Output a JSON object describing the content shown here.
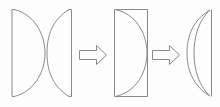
{
  "figure": {
    "description": "Three-stage schematic: two separate plano-convex lens elements are joined into a rectangular blank containing a curved interface, which is then shaped into a finished biconvex lens.",
    "background_color": "#fdfdfd",
    "stroke_color": "#8a8a8a",
    "stroke_width": 1,
    "width": 220,
    "height": 107
  },
  "stages": [
    {
      "id": "stage-1",
      "label": "Two separate lens elements",
      "elements": [
        {
          "id": "element-1a",
          "name": "plano-convex-lens-left",
          "shape": "plano-convex",
          "flat_side": "left",
          "curved_side": "right",
          "bbox": {
            "x": 11,
            "y": 9,
            "width": 34,
            "height": 88
          }
        },
        {
          "id": "element-1b",
          "name": "concave-convex-lens-right",
          "shape": "plano-convex",
          "flat_side": "right",
          "curved_side": "left",
          "bbox": {
            "x": 47,
            "y": 9,
            "width": 25,
            "height": 88
          }
        }
      ]
    },
    {
      "id": "stage-2",
      "label": "Bonded rectangular blank with curved interface",
      "elements": [
        {
          "id": "element-2a",
          "name": "bonded-lens-blank",
          "shape": "rectangle-with-internal-arc",
          "arc_bulge": "right",
          "bbox": {
            "x": 114,
            "y": 9,
            "width": 34,
            "height": 88
          }
        }
      ]
    },
    {
      "id": "stage-3",
      "label": "Finished biconvex lens",
      "elements": [
        {
          "id": "element-3a",
          "name": "biconvex-lens",
          "shape": "biconvex-leaf",
          "flat_edge": "right",
          "bbox": {
            "x": 186,
            "y": 9,
            "width": 27,
            "height": 88
          }
        }
      ]
    }
  ],
  "arrows": [
    {
      "id": "arrow-1",
      "name": "process-arrow-1",
      "direction": "right",
      "style": "hollow-outline",
      "from_stage": "stage-1",
      "to_stage": "stage-2",
      "bbox": {
        "x": 79,
        "y": 45,
        "width": 28,
        "height": 20
      }
    },
    {
      "id": "arrow-2",
      "name": "process-arrow-2",
      "direction": "right",
      "style": "hollow-outline",
      "from_stage": "stage-2",
      "to_stage": "stage-3",
      "bbox": {
        "x": 152,
        "y": 45,
        "width": 28,
        "height": 20
      }
    }
  ],
  "labels": {
    "none_visible": ""
  }
}
